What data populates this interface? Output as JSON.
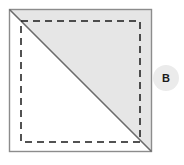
{
  "diagram": {
    "title": "",
    "type": "sewing-half-square-triangle-unit",
    "colors": {
      "fabric_shaded_fill": "#e6e6e6",
      "fabric_plain_fill": "#ffffff",
      "outline_stroke": "#8c8c8c",
      "diagonal_stroke": "#6b6b6b",
      "stitch_dash_stroke": "#1a1a1a",
      "badge_fill": "#ebebeb",
      "badge_text": "#1a1a1a"
    },
    "square": {
      "label": "fabric-square",
      "x": 9,
      "y": 9,
      "width": 143,
      "height": 143
    },
    "shaded_triangle": {
      "label": "shaded-upper-right-triangle",
      "points": "9,9 152,9 152,152"
    },
    "plain_triangle": {
      "label": "plain-lower-left-triangle",
      "points": "9,9 9,152 152,152"
    },
    "diagonal_line": {
      "label": "diagonal-fold-line",
      "x1": 9,
      "y1": 9,
      "x2": 152,
      "y2": 152
    },
    "stitch_rectangle": {
      "label": "dashed-stitch-line",
      "x": 21,
      "y": 21,
      "width": 119,
      "height": 121,
      "dash_pattern": "7,5"
    },
    "badge": {
      "letter": "B",
      "cx": 166,
      "cy": 78,
      "r": 13
    }
  }
}
